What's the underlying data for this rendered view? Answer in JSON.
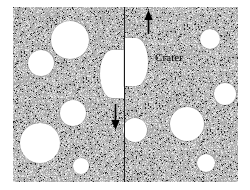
{
  "figure": {
    "name": "offset-crater-fault-diagram",
    "width": 250,
    "height": 190,
    "background_color": "#ffffff"
  },
  "terrain": {
    "name": "speckled-ground-surface",
    "base_color": "#b4b4b4",
    "speckle_dark_color": "#2b2b2b",
    "speckle_light_color": "#e8e8e8",
    "x": 13,
    "y": 7,
    "width": 225,
    "height": 175
  },
  "fault": {
    "label": "",
    "line_color": "#1a1a1a",
    "x": 111,
    "orientation": "vertical",
    "sense": "right-lateral-vertical-offset"
  },
  "arrows": [
    {
      "name": "up-arrow",
      "direction": "up",
      "color": "#000000",
      "x": 129,
      "y": 3,
      "length": 24,
      "side": "right-block"
    },
    {
      "name": "down-arrow",
      "direction": "down",
      "color": "#000000",
      "x": 96,
      "y": 97,
      "length": 26,
      "side": "left-block"
    }
  ],
  "labels": {
    "crater": "Crater",
    "crater_x": 155,
    "crater_y": 51,
    "crater_color": "#000000",
    "crater_font_size": 11
  },
  "offset_crater": {
    "name": "fault-offset-crater",
    "description": "Large crater cut and vertically offset by the fault",
    "radius": 24,
    "left_half": {
      "cx": 111,
      "cy": 67,
      "r": 24
    },
    "right_half": {
      "cx": 111,
      "cy": 55,
      "r": 24
    },
    "vertical_offset": 12,
    "fill_color": "#ffffff"
  },
  "craters": [
    {
      "name": "crater-upper-left-large",
      "cx": 57,
      "cy": 33,
      "r": 19
    },
    {
      "name": "crater-left-mid",
      "cx": 28,
      "cy": 56,
      "r": 13
    },
    {
      "name": "crater-left-center",
      "cx": 60,
      "cy": 106,
      "r": 13
    },
    {
      "name": "crater-lower-left-large",
      "cx": 27,
      "cy": 136,
      "r": 20
    },
    {
      "name": "crater-lower-left-small",
      "cx": 68,
      "cy": 159,
      "r": 8
    },
    {
      "name": "crater-right-upper-small",
      "cx": 197,
      "cy": 32,
      "r": 10
    },
    {
      "name": "crater-right-mid-small",
      "cx": 212,
      "cy": 87,
      "r": 11
    },
    {
      "name": "crater-right-center",
      "cx": 174,
      "cy": 117,
      "r": 17
    },
    {
      "name": "crater-fault-right-small",
      "cx": 122,
      "cy": 123,
      "r": 12
    },
    {
      "name": "crater-lower-right-small",
      "cx": 193,
      "cy": 156,
      "r": 9
    }
  ]
}
